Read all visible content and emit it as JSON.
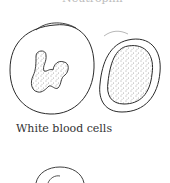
{
  "figure": {
    "top_label_clipped": "Neutrophil",
    "caption": "White blood cells",
    "cells": [
      {
        "name": "neutrophil",
        "description": "Large round cell with multi-lobed stippled nucleus"
      },
      {
        "name": "lymphocyte",
        "description": "Oval cell with large stippled nucleus filling most of the cell"
      },
      {
        "name": "partial-cell",
        "description": "Partially visible cell at bottom edge"
      }
    ],
    "colors": {
      "line": "#2a2a2a",
      "stipple": "#444444",
      "background": "#ffffff"
    }
  }
}
